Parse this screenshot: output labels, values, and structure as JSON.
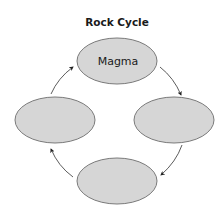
{
  "diagram": {
    "title": "Rock Cycle",
    "colors": {
      "node_fill": "#d6d6d6",
      "node_stroke": "#7a7a7a",
      "arrow": "#333333",
      "text": "#1a1a1a",
      "background": "#ffffff"
    },
    "nodes": [
      {
        "id": "top",
        "label": "Magma"
      },
      {
        "id": "right",
        "label": ""
      },
      {
        "id": "bottom",
        "label": ""
      },
      {
        "id": "left",
        "label": ""
      }
    ],
    "edges": [
      {
        "from": "top",
        "to": "right"
      },
      {
        "from": "right",
        "to": "bottom"
      },
      {
        "from": "bottom",
        "to": "left"
      },
      {
        "from": "left",
        "to": "top"
      }
    ],
    "direction": "clockwise"
  }
}
